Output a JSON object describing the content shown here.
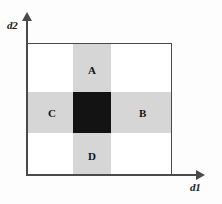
{
  "figure": {
    "type": "diagram",
    "axes": {
      "x": {
        "name": "axis-d1",
        "label": "d1",
        "arrow": "arrow-right"
      },
      "y": {
        "name": "axis-d2",
        "label": "d2",
        "arrow": "arrow-up"
      }
    },
    "regions": [
      {
        "id": "A",
        "label": "A",
        "position": "top-center",
        "fill": "grey"
      },
      {
        "id": "B",
        "label": "B",
        "position": "middle-right",
        "fill": "grey"
      },
      {
        "id": "C",
        "label": "C",
        "position": "middle-left",
        "fill": "grey"
      },
      {
        "id": "D",
        "label": "D",
        "position": "bottom-center",
        "fill": "grey"
      }
    ],
    "bands": {
      "vertical_label": "vertical-band",
      "horizontal_label": "horizontal-band",
      "intersection_label": "intersection-cell"
    },
    "colors": {
      "band_fill": "#d6d6d6",
      "intersection_fill": "#131313",
      "outline": "#4a4a4a",
      "background": "#ffffff",
      "text": "#141414"
    }
  },
  "chart_data": {
    "type": "heatmap",
    "title": "",
    "xlabel": "d1",
    "ylabel": "d2",
    "grid": false,
    "legend": "none",
    "columns": [
      "left",
      "center",
      "right"
    ],
    "rows": [
      "top",
      "middle",
      "bottom"
    ],
    "cells": [
      {
        "row": "top",
        "col": "left",
        "fill": "white",
        "label": ""
      },
      {
        "row": "top",
        "col": "center",
        "fill": "grey",
        "label": "A"
      },
      {
        "row": "top",
        "col": "right",
        "fill": "white",
        "label": ""
      },
      {
        "row": "middle",
        "col": "left",
        "fill": "grey",
        "label": "C"
      },
      {
        "row": "middle",
        "col": "center",
        "fill": "black",
        "label": ""
      },
      {
        "row": "middle",
        "col": "right",
        "fill": "grey",
        "label": "B"
      },
      {
        "row": "bottom",
        "col": "left",
        "fill": "white",
        "label": ""
      },
      {
        "row": "bottom",
        "col": "center",
        "fill": "grey",
        "label": "D"
      },
      {
        "row": "bottom",
        "col": "right",
        "fill": "white",
        "label": ""
      }
    ]
  }
}
